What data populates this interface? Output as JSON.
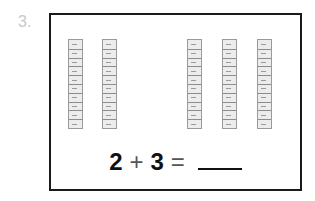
{
  "question": {
    "number": "3."
  },
  "rods": {
    "left_group": [
      {
        "id": 1
      },
      {
        "id": 2
      }
    ],
    "right_group": [
      {
        "id": 1
      },
      {
        "id": 2
      },
      {
        "id": 3
      }
    ],
    "segments_per_rod": 10
  },
  "equation": {
    "a": "2",
    "op": "+",
    "b": "3",
    "equals": "="
  }
}
